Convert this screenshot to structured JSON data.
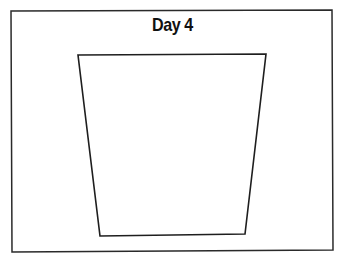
{
  "title": "Day 4",
  "colors": {
    "background": "#ffffff",
    "stroke": "#2a2a2a",
    "text": "#111111"
  },
  "frame": {
    "points": "11,11 332,10 333,250 12,252"
  },
  "shape": {
    "type": "trapezoid",
    "points": "78,55 266,54 245,234 100,236"
  }
}
